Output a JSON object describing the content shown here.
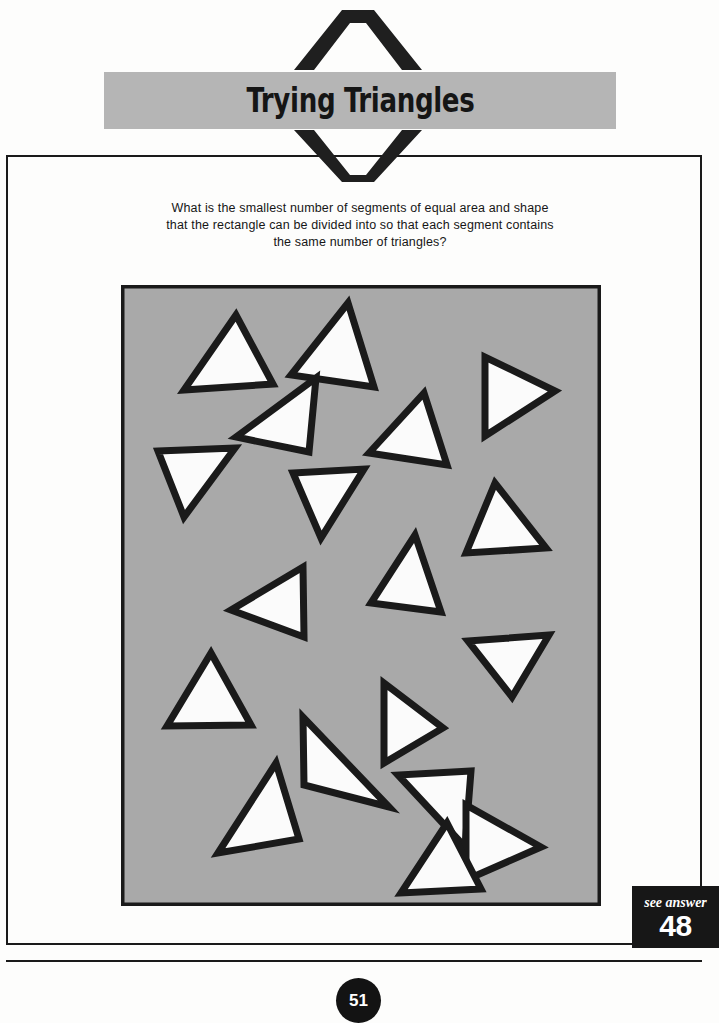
{
  "page": {
    "title": "Trying Triangles",
    "page_number": "51",
    "background_color": "#fdfdfc",
    "banner_color": "#b5b5b5",
    "ink_color": "#1a1a1a"
  },
  "header": {
    "banner_title": "Trying Triangles",
    "chevron_top_icon": "chevron-up-icon",
    "chevron_bottom_icon": "chevron-down-icon"
  },
  "question": {
    "text": "What is the smallest number of segments of equal area and shape that the rectangle can be divided into so that each segment contains the same number of triangles?"
  },
  "answer_ref": {
    "label": "see answer",
    "number": "48"
  },
  "puzzle_figure": {
    "type": "triangle-scatter-panel",
    "panel_background_color": "#a9a9a9",
    "panel_border_color": "#1a1a1a",
    "triangle_fill_color": "#fbfbfb",
    "triangle_outline_color": "#1a1a1a",
    "triangle_count": 18,
    "panel_width": 480,
    "panel_height": 621,
    "triangles": [
      {
        "id": 1,
        "points": "63,105 115,30 152,99",
        "label": "triangle-1"
      },
      {
        "id": 2,
        "points": "170,90 227,18 253,102",
        "label": "triangle-2"
      },
      {
        "id": 3,
        "points": "115,152 195,93 188,167",
        "label": "triangle-3"
      },
      {
        "id": 4,
        "points": "248,168 303,108 326,180",
        "label": "triangle-4"
      },
      {
        "id": 5,
        "points": "364,151 364,72 434,106",
        "label": "triangle-5"
      },
      {
        "id": 6,
        "points": "37,166 114,163 63,232",
        "label": "triangle-6"
      },
      {
        "id": 7,
        "points": "172,188 243,184 200,253",
        "label": "triangle-7"
      },
      {
        "id": 8,
        "points": "345,268 374,198 425,263",
        "label": "triangle-8"
      },
      {
        "id": 9,
        "points": "250,318 294,250 320,327",
        "label": "triangle-9"
      },
      {
        "id": 10,
        "points": "110,325 182,282 183,352",
        "label": "triangle-10"
      },
      {
        "id": 11,
        "points": "347,356 428,350 391,412",
        "label": "triangle-11"
      },
      {
        "id": 12,
        "points": "46,441 90,368 130,440",
        "label": "triangle-12"
      },
      {
        "id": 13,
        "points": "263,398 263,478 322,443",
        "label": "triangle-13"
      },
      {
        "id": 14,
        "points": "268,522 182,432 183,500",
        "label": "triangle-14"
      },
      {
        "id": 15,
        "points": "97,568 155,478 178,554",
        "label": "triangle-15"
      },
      {
        "id": 16,
        "points": "344,562 277,490 350,486",
        "label": "triangle-16"
      },
      {
        "id": 17,
        "points": "345,595 345,520 420,562",
        "label": "triangle-17"
      },
      {
        "id": 18,
        "points": "280,608 326,538 360,604",
        "label": "triangle-18"
      }
    ]
  }
}
